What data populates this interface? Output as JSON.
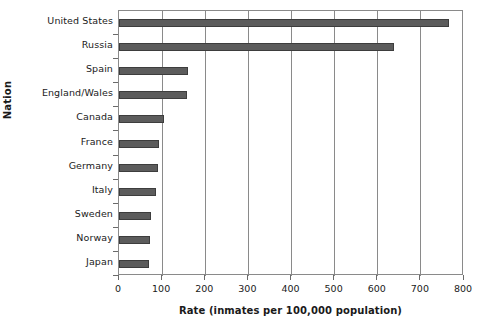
{
  "chart_data": {
    "type": "bar",
    "orientation": "horizontal",
    "title": "",
    "xlabel": "Rate (inmates per 100,000 population)",
    "ylabel": "Nation",
    "categories": [
      "United States",
      "Russia",
      "Spain",
      "England/Wales",
      "Canada",
      "France",
      "Germany",
      "Italy",
      "Sweden",
      "Norway",
      "Japan"
    ],
    "values": [
      765,
      637,
      160,
      157,
      104,
      93,
      90,
      86,
      75,
      72,
      69
    ],
    "xlim": [
      0,
      800
    ],
    "xticks": [
      0,
      100,
      200,
      300,
      400,
      500,
      600,
      700,
      800
    ],
    "xtick_labels": [
      "0",
      "100",
      "200",
      "300",
      "400",
      "500",
      "600",
      "700",
      "800"
    ],
    "grid": "vertical",
    "legend": null,
    "bar_color": "#5c5c5c",
    "bar_edge_color": "#3d3d3d",
    "frame_color": "#8a8a8a",
    "background": "#ffffff"
  }
}
